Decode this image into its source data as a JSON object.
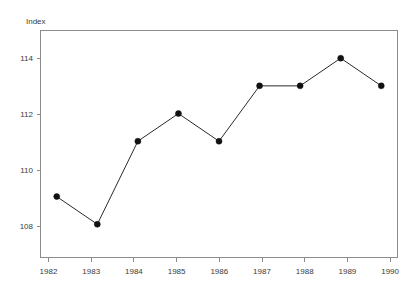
{
  "chart_data": {
    "type": "line",
    "title": "",
    "subtitle": "",
    "xlabel": "",
    "ylabel": "Index",
    "categories": [
      "1982",
      "1983",
      "1984",
      "1985",
      "1986",
      "1987",
      "1988",
      "1989",
      "1990"
    ],
    "x": [
      1982,
      1983,
      1984,
      1985,
      1986,
      1987,
      1988,
      1989,
      1990
    ],
    "values": [
      109,
      108,
      111,
      112,
      111,
      113,
      113,
      114,
      113
    ],
    "series": [
      {
        "name": "Index",
        "values": [
          109,
          108,
          111,
          112,
          111,
          113,
          113,
          114,
          113
        ]
      }
    ],
    "ylim": [
      106.8,
      115.0
    ],
    "xlim": [
      1981.6,
      1990.4
    ],
    "yticks": [
      108,
      110,
      112,
      114
    ],
    "ytick_labels": [
      "108",
      "110",
      "112",
      "114"
    ],
    "xticks": [
      1982,
      1983,
      1984,
      1985,
      1986,
      1987,
      1988,
      1989,
      1990
    ],
    "xtick_labels": [
      "1982",
      "1983",
      "1984",
      "1985",
      "1986",
      "1987",
      "1988",
      "1989",
      "1990"
    ],
    "grid": false,
    "legend": false,
    "legend_position": "none",
    "marker": "filled-circle",
    "line_color": "#2b2b2b",
    "marker_color": "#111111",
    "frame_color": "#8c8c8c",
    "text_color": "#3a3a3a",
    "background": "#ffffff",
    "annotations": []
  },
  "axis_labels": {
    "y_title": "Index"
  },
  "ticks": {
    "y": [
      "108",
      "110",
      "112",
      "114"
    ],
    "x": [
      "1982",
      "1983",
      "1984",
      "1985",
      "1986",
      "1987",
      "1988",
      "1989",
      "1990"
    ]
  }
}
